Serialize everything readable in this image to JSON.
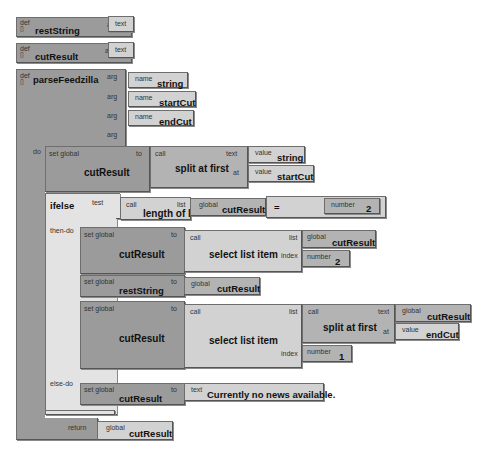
{
  "globals": [
    {
      "keyword": "def",
      "name": "restString",
      "as_label": "as",
      "type": "text"
    },
    {
      "keyword": "def",
      "name": "cutResult",
      "as_label": "as",
      "type": "text"
    }
  ],
  "procedure": {
    "keyword": "def",
    "name": "parseFeedzilla",
    "arg_label": "arg",
    "name_label": "name",
    "args": [
      "string",
      "startCut",
      "endCut",
      ""
    ],
    "do_label": "do",
    "return_label": "return",
    "return_value": {
      "kind": "global",
      "name": "cutResult"
    }
  },
  "statements": {
    "set1": {
      "label": "set global",
      "var": "cutResult",
      "to": "to",
      "call": "call",
      "func": "split at first",
      "text_label": "text",
      "text_kind": "value",
      "text_val": "string",
      "at_label": "at",
      "at_kind": "value",
      "at_val": "startCut"
    },
    "ifelse": {
      "label": "ifelse",
      "test_label": "test",
      "then_label": "then-do",
      "else_label": "else-do",
      "call": "call",
      "func": "length of list",
      "list_label": "list",
      "list_kind": "global",
      "list_val": "cutResult",
      "op": "=",
      "num_kind": "number",
      "num_val": "2"
    },
    "then1": {
      "label": "set global",
      "var": "cutResult",
      "to": "to",
      "call": "call",
      "func": "select list item",
      "list_label": "list",
      "list_kind": "global",
      "list_val": "cutResult",
      "index_label": "index",
      "index_kind": "number",
      "index_val": "2"
    },
    "then2": {
      "label": "set global",
      "var": "restString",
      "to": "to",
      "kind": "global",
      "val": "cutResult"
    },
    "then3": {
      "label": "set global",
      "var": "cutResult",
      "to": "to",
      "call": "call",
      "func": "select list item",
      "list_label": "list",
      "inner_call": "call",
      "inner_func": "split at first",
      "text_label": "text",
      "text_kind": "global",
      "text_val": "cutResult",
      "at_label": "at",
      "at_kind": "value",
      "at_val": "endCut",
      "index_label": "index",
      "index_kind": "number",
      "index_val": "1"
    },
    "else1": {
      "label": "set global",
      "var": "cutResult",
      "to": "to",
      "kind": "text",
      "val": "Currently no news available."
    }
  },
  "colors": {
    "dark": "#9b9b9b",
    "mid": "#b3b3b3",
    "light": "#d2d2d2",
    "pale": "#e3e3e3",
    "border": "#6e6e6e"
  }
}
